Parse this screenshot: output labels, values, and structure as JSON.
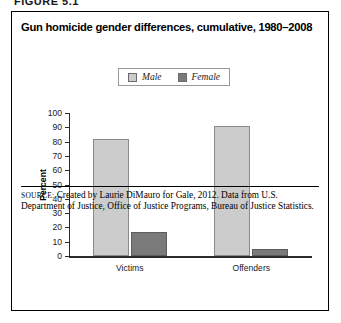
{
  "figure_caption": "FIGURE 5.1",
  "chart_title": "Gun homicide gender differences, cumulative, 1980–2008",
  "legend": {
    "position": "top-center",
    "entries": [
      {
        "label": "Male",
        "color": "#cccccc"
      },
      {
        "label": "Female",
        "color": "#7a7a7a"
      }
    ]
  },
  "source": {
    "prefix": "Source:",
    "text": " Created by Laurie DiMauro for Gale, 2012. Data from U.S. Department of Justice, Office of Justice Programs, Bureau of Justice Statistics."
  },
  "chart_data": {
    "type": "bar",
    "title": "Gun homicide gender differences, cumulative, 1980–2008",
    "xlabel": "",
    "ylabel": "Percent",
    "categories": [
      "Victims",
      "Offenders"
    ],
    "series": [
      {
        "name": "Male",
        "color": "#cccccc",
        "values": [
          82,
          91
        ]
      },
      {
        "name": "Female",
        "color": "#7a7a7a",
        "values": [
          17,
          5
        ]
      }
    ],
    "ylim": [
      0,
      100
    ],
    "yticks": [
      0,
      10,
      20,
      30,
      40,
      50,
      60,
      70,
      80,
      90,
      100
    ],
    "ytick_labels": [
      "0",
      "10",
      "20",
      "30",
      "40",
      "50",
      "60",
      "70",
      "80",
      "90",
      "100"
    ],
    "grid": false,
    "legend_position": "top-center"
  }
}
